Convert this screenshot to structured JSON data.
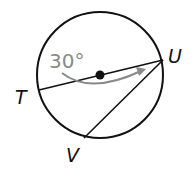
{
  "diagram": {
    "type": "circle-geometry",
    "points": {
      "T": {
        "label": "T"
      },
      "U": {
        "label": "U"
      },
      "V": {
        "label": "V"
      }
    },
    "angle_label": "30°",
    "elements": [
      "circle",
      "center-point",
      "diameter-TU",
      "chord-UV",
      "rotation-arrow"
    ],
    "colors": {
      "stroke": "#111111",
      "arrow": "#8a8a8a",
      "angle_text": "#8a8a8a"
    }
  }
}
